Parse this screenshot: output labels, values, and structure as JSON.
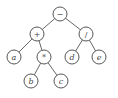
{
  "diagram": {
    "type": "expression-tree",
    "nodes": [
      {
        "id": "root",
        "label": "−",
        "x": 60,
        "y": 14,
        "italic": false
      },
      {
        "id": "plus",
        "label": "+",
        "x": 37,
        "y": 34,
        "italic": false
      },
      {
        "id": "div",
        "label": "/",
        "x": 86,
        "y": 34,
        "italic": false
      },
      {
        "id": "a",
        "label": "a",
        "x": 14,
        "y": 57,
        "italic": true
      },
      {
        "id": "mul",
        "label": "*",
        "x": 44,
        "y": 57,
        "italic": false
      },
      {
        "id": "d",
        "label": "d",
        "x": 72,
        "y": 57,
        "italic": true
      },
      {
        "id": "e",
        "label": "e",
        "x": 99,
        "y": 57,
        "italic": true
      },
      {
        "id": "b",
        "label": "b",
        "x": 31,
        "y": 81,
        "italic": true
      },
      {
        "id": "c",
        "label": "c",
        "x": 61,
        "y": 81,
        "italic": true
      }
    ],
    "edges": [
      [
        "root",
        "plus"
      ],
      [
        "root",
        "div"
      ],
      [
        "plus",
        "a"
      ],
      [
        "plus",
        "mul"
      ],
      [
        "mul",
        "b"
      ],
      [
        "mul",
        "c"
      ],
      [
        "div",
        "d"
      ],
      [
        "div",
        "e"
      ]
    ],
    "node_radius": 7,
    "colors": {
      "stroke": "#444444",
      "fill": "#ffffff",
      "text": "#444444"
    }
  }
}
